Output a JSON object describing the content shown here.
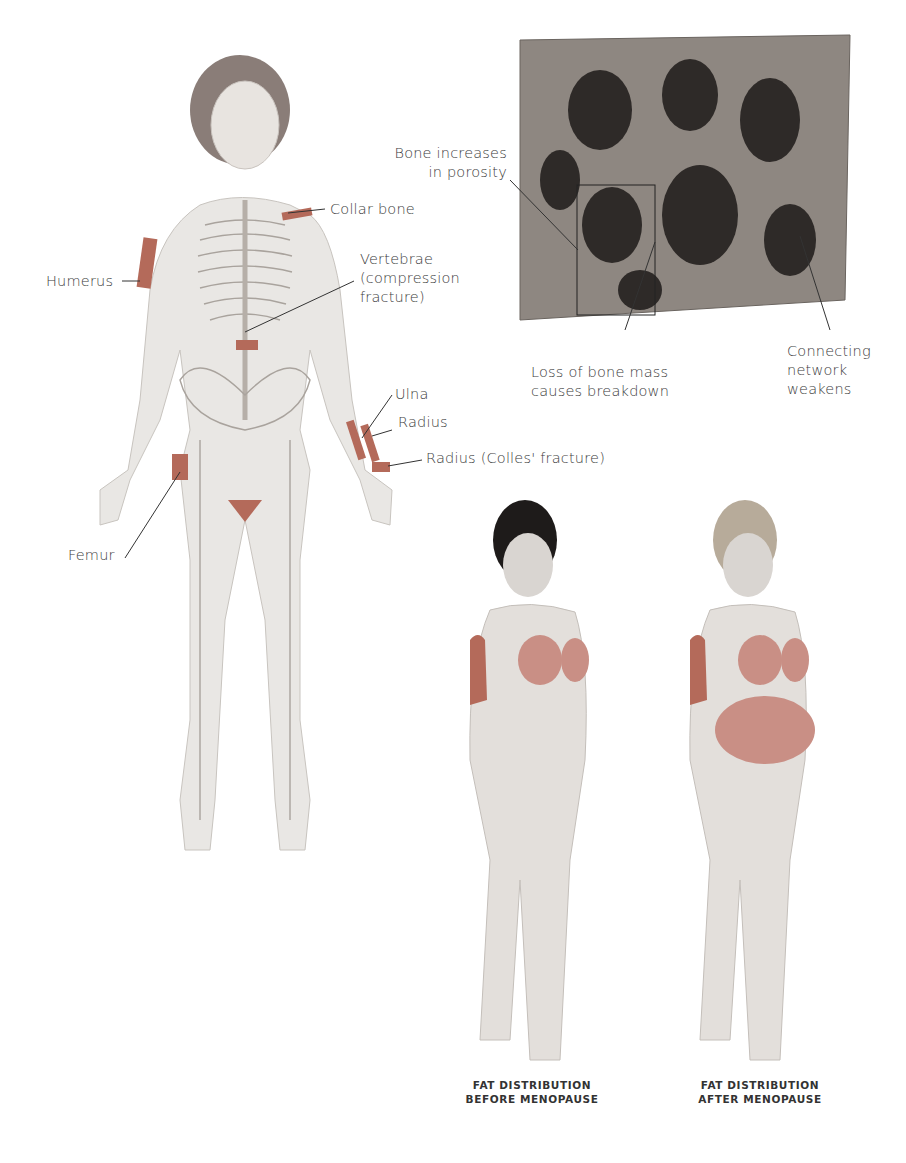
{
  "skeleton_labels": {
    "collar_bone": "Collar bone",
    "humerus": "Humerus",
    "vertebrae": [
      "Vertebrae",
      "(compression",
      "fracture)"
    ],
    "ulna": "Ulna",
    "radius": "Radius",
    "radius_colles": "Radius (Colles' fracture)",
    "femur": "Femur"
  },
  "bone_labels": {
    "porosity": [
      "Bone increases",
      "in porosity"
    ],
    "loss": [
      "Loss of bone mass",
      "causes breakdown"
    ],
    "network": [
      "Connecting",
      "network",
      "weakens"
    ]
  },
  "captions": {
    "before": [
      "FAT DISTRIBUTION",
      "BEFORE MENOPAUSE"
    ],
    "after": [
      "FAT DISTRIBUTION",
      "AFTER MENOPAUSE"
    ]
  },
  "colors": {
    "highlight": "#b46a5a",
    "bone": "#8a8a8a",
    "skin": "#e6e3df"
  }
}
